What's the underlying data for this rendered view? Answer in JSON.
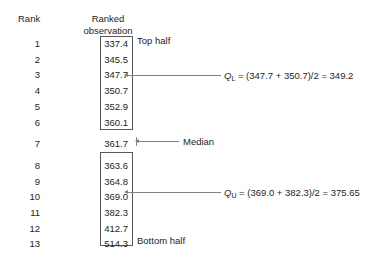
{
  "headers": {
    "rank": "Rank",
    "observation_line1": "Ranked",
    "observation_line2": "observation"
  },
  "rows": [
    {
      "rank": "1",
      "value": "337.4"
    },
    {
      "rank": "2",
      "value": "345.5"
    },
    {
      "rank": "3",
      "value": "347.7"
    },
    {
      "rank": "4",
      "value": "350.7"
    },
    {
      "rank": "5",
      "value": "352.9"
    },
    {
      "rank": "6",
      "value": "360.1"
    },
    {
      "rank": "7",
      "value": "361.7"
    },
    {
      "rank": "8",
      "value": "363.6"
    },
    {
      "rank": "9",
      "value": "364.8"
    },
    {
      "rank": "10",
      "value": "369.0"
    },
    {
      "rank": "11",
      "value": "382.3"
    },
    {
      "rank": "12",
      "value": "412.7"
    },
    {
      "rank": "13",
      "value": "514.3"
    }
  ],
  "labels": {
    "top_half": "Top half",
    "bottom_half": "Bottom half",
    "median": "Median"
  },
  "annotations": {
    "lower_quartile": {
      "symbol": "Q",
      "subscript": "L",
      "formula": " = (347.7 + 350.7)/2 = 349.2"
    },
    "upper_quartile": {
      "symbol": "Q",
      "subscript": "U",
      "formula": " = (369.0 + 382.3)/2 = 375.65"
    }
  },
  "colors": {
    "background": "#ffffff",
    "text": "#231f20",
    "box_stroke": "#58595b",
    "leader_line": "#808285"
  }
}
